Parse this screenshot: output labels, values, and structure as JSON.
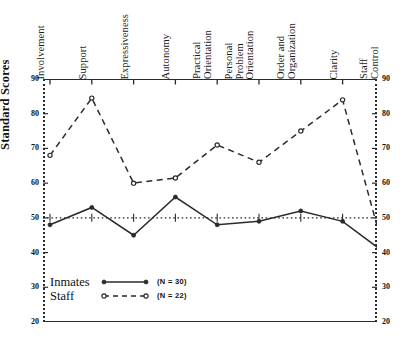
{
  "chart_data": {
    "type": "line",
    "title": "",
    "xlabel": "",
    "ylabel": "Standard Scores",
    "ylim": [
      20,
      90
    ],
    "yticks": [
      20,
      30,
      40,
      50,
      60,
      70,
      80,
      90
    ],
    "ytick_labels_left": [
      "90",
      "80",
      "70",
      "60",
      "50",
      "40",
      "30",
      "20"
    ],
    "ytick_labels_right": [
      "90",
      "80",
      "70",
      "60",
      "50",
      "40",
      "30",
      "20"
    ],
    "grid": false,
    "reference_line": 50,
    "legend_position": "bottom-left",
    "categories": [
      "Involvement",
      "Support",
      "Expressiveness",
      "Autonomy",
      "Practical Orientation",
      "Personal Problem Orientation",
      "Order and Organization",
      "Clarity",
      "Staff Control"
    ],
    "category_lines": [
      [
        "Involvement"
      ],
      [
        "Support"
      ],
      [
        "Expressiveness"
      ],
      [
        "Autonomy"
      ],
      [
        "Practical",
        "Orientation"
      ],
      [
        "Personal",
        "Problem",
        "Orientation"
      ],
      [
        "Order and",
        "Organization"
      ],
      [
        "Clarity"
      ],
      [
        "Staff",
        "Control"
      ]
    ],
    "series": [
      {
        "name": "Inmates",
        "n_label": "(N = 30)",
        "style": "solid",
        "marker": "filled-circle",
        "values": [
          48,
          53,
          45,
          56,
          48,
          49,
          52,
          49,
          40
        ]
      },
      {
        "name": "Staff",
        "n_label": "(N = 22)",
        "style": "dashed",
        "marker": "open-circle",
        "values": [
          68,
          84.5,
          60,
          61.5,
          71,
          66,
          75,
          84,
          40
        ]
      }
    ]
  },
  "axis": {
    "y_title": "Standard Scores"
  },
  "legend": {
    "rows": [
      {
        "name": "Inmates",
        "n": "(N = 30)"
      },
      {
        "name": "Staff",
        "n": "(N = 22)"
      }
    ]
  },
  "colors": {
    "ink": "#2b2b2b",
    "text": "#111111",
    "background": "#ffffff"
  }
}
